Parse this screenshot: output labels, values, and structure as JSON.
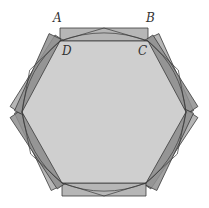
{
  "diagram": {
    "type": "geometry-figure",
    "labels": {
      "A": "A",
      "B": "B",
      "C": "C",
      "D": "D"
    },
    "colors": {
      "background": "#ffffff",
      "hexagon_fill": "#cfcfcf",
      "strip_fill": "#a9a9a9",
      "strip_fill_dark": "#8f8f8f",
      "stroke": "#3a3a3a"
    },
    "hexagon_vertices": [
      [
        60,
        41
      ],
      [
        148,
        41
      ],
      [
        186,
        112
      ],
      [
        146,
        183
      ],
      [
        62,
        183
      ],
      [
        22,
        112
      ]
    ],
    "rectangle_ABCD": {
      "A": [
        60,
        28
      ],
      "B": [
        149,
        28
      ],
      "C": [
        148,
        41
      ],
      "D": [
        60,
        41
      ]
    },
    "strip_thickness": 13
  }
}
